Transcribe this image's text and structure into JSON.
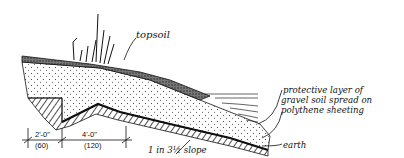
{
  "diagram": {
    "type": "cross-section",
    "labels": {
      "topsoil": "topsoil",
      "protective_line1": "protective layer of",
      "protective_line2": "gravel soil spread on",
      "protective_line3": "polythene sheeting",
      "earth": "earth",
      "slope": "1 in 3½ slope"
    },
    "dimensions": [
      {
        "imperial": "2'-0\"",
        "metric": "(60)"
      },
      {
        "imperial": "4'-0\"",
        "metric": "(120)"
      }
    ],
    "colors": {
      "ink": "#111111",
      "background": "#ffffff"
    }
  }
}
